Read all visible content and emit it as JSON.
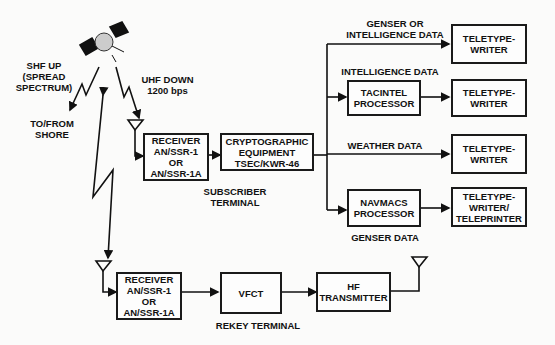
{
  "diagram": {
    "satellite": {
      "uplink_label": "SHF UP\n(SPREAD\nSPECTRUM)",
      "downlink_label": "UHF DOWN\n1200 bps",
      "shore_label": "TO/FROM\nSHORE"
    },
    "subscriber_terminal": {
      "label": "SUBSCRIBER\nTERMINAL",
      "receiver": "RECEIVER\nAN/SSR-1\nOR\nAN/SSR-1A",
      "crypto": "CRYPTOGRAPHIC\nEQUIPMENT\nTSEC/KWR-46"
    },
    "outputs": [
      {
        "line_label": "GENSER OR\nINTELLIGENCE DATA",
        "device": "TELETYPE-\nWRITER"
      },
      {
        "line_label": "INTELLIGENCE DATA",
        "processor": "TACINTEL\nPROCESSOR",
        "device": "TELETYPE-\nWRITER"
      },
      {
        "line_label": "WEATHER DATA",
        "device": "TELETYPE-\nWRITER"
      },
      {
        "line_label": "GENSER DATA",
        "processor": "NAVMACS\nPROCESSOR",
        "device": "TELETYPE-\nWRITER/\nTELEPRINTER"
      }
    ],
    "rekey_terminal": {
      "label": "REKEY TERMINAL",
      "receiver": "RECEIVER\nAN/SSR-1\nOR\nAN/SSR-1A",
      "vfct": "VFCT",
      "transmitter": "HF\nTRANSMITTER"
    }
  }
}
